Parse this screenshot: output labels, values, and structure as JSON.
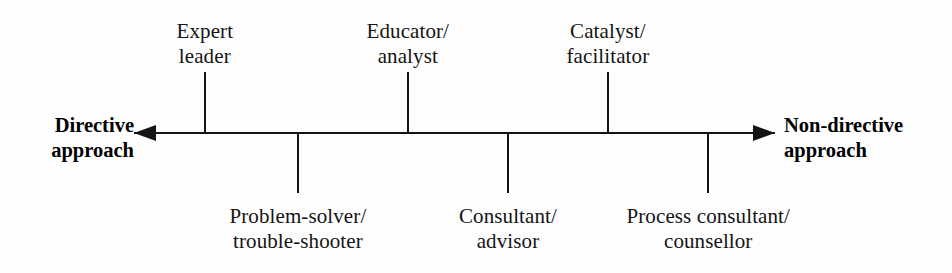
{
  "diagram": {
    "type": "continuum",
    "orientation": "horizontal",
    "background_color": "#fefefe",
    "line_color": "#141414",
    "poles": {
      "left": {
        "name": "directive-pole",
        "line1": "Directive",
        "line2": "approach",
        "arrow_direction": "left"
      },
      "right": {
        "name": "non-directive-pole",
        "line1": "Non-directive",
        "line2": "approach",
        "arrow_direction": "right"
      }
    },
    "axis": {
      "y": 133,
      "start_x": 134,
      "end_x": 775,
      "stroke_width": 2.6,
      "arrowhead_length": 22,
      "arrowhead_half_height": 8
    },
    "roles": [
      {
        "id": "expert-leader",
        "line1": "Expert",
        "line2": "leader",
        "tick_x": 205,
        "side": "above",
        "tick_top": 72,
        "tick_bottom": 133
      },
      {
        "id": "problem-solver-trouble-shooter",
        "line1": "Problem-solver/",
        "line2": "trouble-shooter",
        "tick_x": 298,
        "side": "below",
        "tick_top": 133,
        "tick_bottom": 193
      },
      {
        "id": "educator-analyst",
        "line1": "Educator/",
        "line2": "analyst",
        "tick_x": 408,
        "side": "above",
        "tick_top": 72,
        "tick_bottom": 133
      },
      {
        "id": "consultant-advisor",
        "line1": "Consultant/",
        "line2": "advisor",
        "tick_x": 508,
        "side": "below",
        "tick_top": 133,
        "tick_bottom": 193
      },
      {
        "id": "catalyst-facilitator",
        "line1": "Catalyst/",
        "line2": "facilitator",
        "tick_x": 608,
        "side": "above",
        "tick_top": 72,
        "tick_bottom": 133
      },
      {
        "id": "process-consultant-counsellor",
        "line1": "Process consultant/",
        "line2": "counsellor",
        "tick_x": 708,
        "side": "below",
        "tick_top": 133,
        "tick_bottom": 193
      }
    ]
  }
}
